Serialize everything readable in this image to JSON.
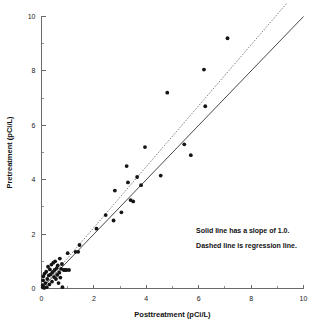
{
  "chart_data": {
    "type": "scatter",
    "title": "",
    "xlabel": "Posttreatment (pCi/L)",
    "ylabel": "Pretreatment (pCi/L)",
    "xlim": [
      0,
      10
    ],
    "ylim": [
      0,
      10
    ],
    "xticks": [
      0,
      2,
      4,
      6,
      8,
      10
    ],
    "yticks": [
      0,
      2,
      4,
      6,
      8,
      10
    ],
    "xtick_labels": [
      "0",
      "2",
      "4",
      "6",
      "8",
      "10"
    ],
    "ytick_labels": [
      "0",
      "2",
      "4",
      "6",
      "8",
      "10"
    ],
    "minor_tick_interval": 1,
    "grid": false,
    "legend": "none",
    "marker": "filled-circle",
    "marker_color": "#141414",
    "points": [
      [
        0.05,
        0.05
      ],
      [
        0.05,
        0.12
      ],
      [
        0.06,
        0.3
      ],
      [
        0.07,
        0.45
      ],
      [
        0.1,
        0.02
      ],
      [
        0.12,
        0.55
      ],
      [
        0.15,
        0.2
      ],
      [
        0.18,
        0.62
      ],
      [
        0.2,
        0.05
      ],
      [
        0.22,
        0.35
      ],
      [
        0.25,
        0.8
      ],
      [
        0.28,
        0.48
      ],
      [
        0.3,
        0.15
      ],
      [
        0.32,
        0.7
      ],
      [
        0.35,
        0.52
      ],
      [
        0.38,
        0.88
      ],
      [
        0.4,
        0.25
      ],
      [
        0.42,
        0.6
      ],
      [
        0.45,
        0.95
      ],
      [
        0.48,
        0.42
      ],
      [
        0.5,
        0.68
      ],
      [
        0.52,
        1.0
      ],
      [
        0.55,
        0.35
      ],
      [
        0.58,
        0.75
      ],
      [
        0.6,
        0.5
      ],
      [
        0.62,
        0.85
      ],
      [
        0.65,
        0.2
      ],
      [
        0.68,
        0.58
      ],
      [
        0.7,
        1.1
      ],
      [
        0.72,
        0.4
      ],
      [
        0.75,
        0.72
      ],
      [
        0.78,
        0.9
      ],
      [
        0.8,
        0.05
      ],
      [
        0.85,
        0.68
      ],
      [
        0.9,
        0.68
      ],
      [
        0.95,
        0.68
      ],
      [
        1.0,
        1.3
      ],
      [
        1.05,
        0.68
      ],
      [
        1.3,
        1.35
      ],
      [
        1.4,
        1.35
      ],
      [
        1.45,
        1.6
      ],
      [
        2.1,
        2.2
      ],
      [
        2.45,
        2.7
      ],
      [
        2.75,
        2.5
      ],
      [
        2.8,
        3.6
      ],
      [
        3.05,
        2.8
      ],
      [
        3.25,
        4.5
      ],
      [
        3.3,
        3.9
      ],
      [
        3.4,
        3.25
      ],
      [
        3.5,
        3.2
      ],
      [
        3.65,
        4.1
      ],
      [
        3.8,
        3.8
      ],
      [
        3.95,
        5.2
      ],
      [
        4.55,
        4.15
      ],
      [
        4.8,
        7.2
      ],
      [
        5.45,
        5.3
      ],
      [
        5.7,
        4.9
      ],
      [
        6.2,
        8.05
      ],
      [
        6.25,
        6.7
      ],
      [
        7.1,
        9.2
      ]
    ],
    "lines": [
      {
        "name": "identity-line",
        "style": "solid",
        "slope": 1.0,
        "intercept": 0.0,
        "x_start": 0.05,
        "x_end": 10.0,
        "color": "#333333"
      },
      {
        "name": "regression-line",
        "style": "dashed",
        "slope": 1.12,
        "intercept": 0.0,
        "x_start": 0.05,
        "x_end": 9.35,
        "color": "#777777"
      }
    ],
    "annotations": [
      {
        "text": "Solid line has a slope of 1.0.",
        "x": 5.9,
        "y": 2.05
      },
      {
        "text": "Dashed line is regression line.",
        "x": 5.9,
        "y": 1.5
      }
    ]
  },
  "figure": {
    "x_axis_title": "Posttreatment (pCi/L)",
    "y_axis_title": "Pretreatment (pCi/L)",
    "note_solid": "Solid line has a slope of 1.0.",
    "note_dashed": "Dashed line is regression line."
  }
}
